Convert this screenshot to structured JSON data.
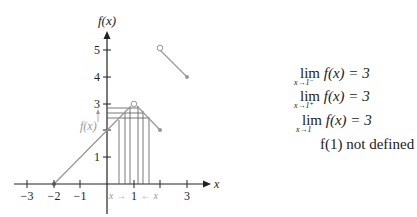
{
  "figure": {
    "y_axis_label": "f(x)",
    "x_axis_label": "x",
    "x_ticks": [
      "−3",
      "−2",
      "−1",
      "1",
      "3"
    ],
    "x_tick_values": [
      -3,
      -2,
      -1,
      1,
      2,
      3
    ],
    "y_ticks": [
      "1",
      "2",
      "3",
      "4",
      "5"
    ],
    "inline_fx_label": "f(x)",
    "approach_left_label": "x →",
    "approach_center_label": "1",
    "approach_right_label": "← x",
    "colors": {
      "axis": "#222222",
      "curve": "#999999",
      "guides": "#555555",
      "annotation": "#9a9a9a"
    }
  },
  "function": {
    "segments": [
      {
        "from": [
          -2,
          0
        ],
        "to": [
          1,
          3
        ],
        "start": "closed",
        "end": "open"
      },
      {
        "from": [
          1,
          3
        ],
        "to": [
          2,
          2
        ],
        "start": "open",
        "end": "closed"
      },
      {
        "from": [
          2,
          5
        ],
        "to": [
          3,
          4
        ],
        "start": "open",
        "end": "closed"
      }
    ]
  },
  "equations": [
    {
      "lim": "lim",
      "sub": "x→1⁻",
      "expr": "f(x) = 3"
    },
    {
      "lim": "lim",
      "sub": "x→1⁺",
      "expr": "f(x) = 3"
    },
    {
      "lim": "lim",
      "sub": "x→1",
      "expr": "f(x) = 3"
    },
    {
      "lim": "",
      "sub": "",
      "expr": "f(1) not defined"
    }
  ]
}
